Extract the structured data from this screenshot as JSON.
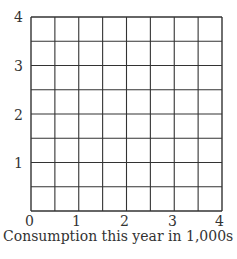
{
  "chart_data": {
    "type": "scatter",
    "title": "",
    "xlabel": "Consumption this year in 1,000s",
    "ylabel": "",
    "xlim": [
      0,
      4
    ],
    "ylim": [
      0,
      4
    ],
    "x_ticks": [
      "0",
      "1",
      "2",
      "3",
      "4"
    ],
    "y_ticks": [
      "1",
      "2",
      "3",
      "4"
    ],
    "grid": true,
    "grid_divisions": {
      "x": 8,
      "y": 8
    },
    "series": [],
    "legend": null
  },
  "colors": {
    "grid_line": "#333333",
    "text": "#333333",
    "background": "#ffffff"
  }
}
